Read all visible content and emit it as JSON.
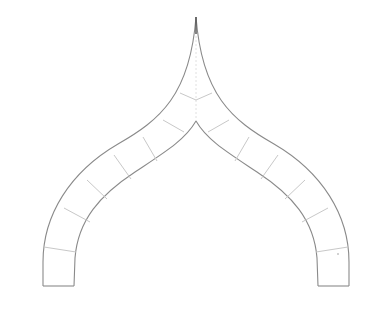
{
  "drawing": {
    "subject": "ogee-arch",
    "colors": {
      "outline": "#8a8a8a",
      "joints": "#c8c8c8",
      "background": "#ffffff"
    },
    "apex": {
      "x": 196,
      "y": 17
    },
    "crown_intrados": {
      "x": 196,
      "y": 121
    },
    "springing_base_y": 286,
    "left_leg": {
      "outer_x": 43,
      "inner_x": 74
    },
    "right_leg": {
      "inner_x": 318,
      "outer_x": 349
    },
    "voussoir_joints_per_side": 8
  }
}
